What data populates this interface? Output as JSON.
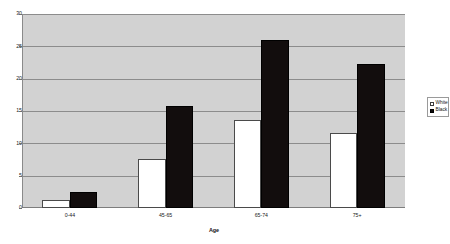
{
  "chart_data": {
    "type": "bar",
    "title": "",
    "subtitle": "",
    "xlabel": "Age",
    "ylabel": "",
    "categories": [
      "0-44",
      "45-65",
      "65-74",
      "75+"
    ],
    "series": [
      {
        "name": "White",
        "color": "#ffffff",
        "values": [
          1.2,
          7.6,
          13.6,
          11.6
        ]
      },
      {
        "name": "Black",
        "color": "#0d0a0a",
        "values": [
          2.5,
          15.7,
          26.0,
          22.3
        ]
      }
    ],
    "ylim": [
      0,
      30
    ],
    "yticks": [
      0,
      5,
      10,
      15,
      20,
      25,
      30
    ],
    "ytick_labels": [
      "0",
      "5",
      "10",
      "15",
      "20",
      "25",
      "30"
    ],
    "grid": true,
    "grid_axis": "y",
    "legend": [
      "White",
      "Black"
    ],
    "legend_position": "right",
    "plot_background": "#d2d2d2",
    "figure_background": "#ffffff"
  },
  "legend": {
    "items": [
      {
        "label": "White",
        "swatch": "legend-swatch-white"
      },
      {
        "label": "Black",
        "swatch": "legend-swatch-black"
      }
    ]
  },
  "axis": {
    "x_title": "Age"
  }
}
